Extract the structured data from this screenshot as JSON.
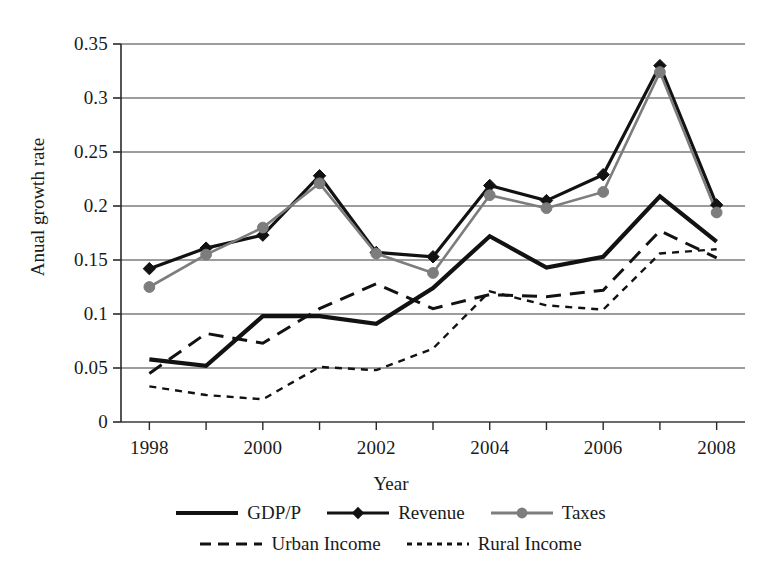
{
  "chart_data": {
    "type": "line",
    "title": "",
    "xlabel": "Year",
    "ylabel": "Anual growth rate",
    "x": [
      1998,
      1999,
      2000,
      2001,
      2002,
      2003,
      2004,
      2005,
      2006,
      2007,
      2008
    ],
    "xtick_labels": [
      "1998",
      "2000",
      "2002",
      "2004",
      "2006",
      "2008"
    ],
    "xtick_values": [
      1998,
      2000,
      2002,
      2004,
      2006,
      2008
    ],
    "xlim": [
      1997.5,
      2008.5
    ],
    "ytick_labels": [
      "0",
      "0.05",
      "0.1",
      "0.15",
      "0.2",
      "0.25",
      "0.3",
      "0.35"
    ],
    "ytick_values": [
      0,
      0.05,
      0.1,
      0.15,
      0.2,
      0.25,
      0.3,
      0.35
    ],
    "ylim": [
      0,
      0.35
    ],
    "grid": "horizontal",
    "legend_position": "bottom",
    "series": [
      {
        "name": "GDP/P",
        "color": "#121212",
        "style": "solid",
        "width": 4.2,
        "marker": "none",
        "values": [
          0.058,
          0.052,
          0.098,
          0.098,
          0.091,
          0.124,
          0.172,
          0.143,
          0.153,
          0.209,
          0.167
        ]
      },
      {
        "name": "Revenue",
        "color": "#121212",
        "style": "solid",
        "width": 3.2,
        "marker": "diamond",
        "values": [
          0.142,
          0.161,
          0.173,
          0.228,
          0.157,
          0.153,
          0.219,
          0.205,
          0.229,
          0.33,
          0.201
        ]
      },
      {
        "name": "Taxes",
        "color": "#7d7d7d",
        "style": "solid",
        "width": 2.6,
        "marker": "circle",
        "values": [
          0.125,
          0.155,
          0.18,
          0.221,
          0.156,
          0.138,
          0.21,
          0.198,
          0.213,
          0.324,
          0.194
        ]
      },
      {
        "name": "Urban Income",
        "color": "#121212",
        "style": "dashed-long",
        "width": 3.0,
        "marker": "none",
        "values": [
          0.045,
          0.082,
          0.073,
          0.105,
          0.128,
          0.105,
          0.118,
          0.116,
          0.122,
          0.177,
          0.152
        ]
      },
      {
        "name": "Rural Income",
        "color": "#121212",
        "style": "dashed-short",
        "width": 2.4,
        "marker": "none",
        "values": [
          0.033,
          0.025,
          0.021,
          0.051,
          0.048,
          0.068,
          0.121,
          0.108,
          0.104,
          0.156,
          0.16
        ]
      }
    ]
  },
  "axes": {
    "ylabel": "Anual growth rate",
    "xlabel": "Year",
    "yticks": [
      "0.35",
      "0.3",
      "0.25",
      "0.2",
      "0.15",
      "0.1",
      "0.05",
      "0"
    ],
    "xticks": [
      "1998",
      "2000",
      "2002",
      "2004",
      "2006",
      "2008"
    ]
  },
  "legend": {
    "row1": [
      {
        "label": "GDP/P",
        "icon": "solid-line-swatch"
      },
      {
        "label": "Revenue",
        "icon": "diamond-marker-line-swatch"
      },
      {
        "label": "Taxes",
        "icon": "circle-marker-line-swatch"
      }
    ],
    "row2": [
      {
        "label": "Urban Income",
        "icon": "long-dashed-line-swatch"
      },
      {
        "label": "Rural Income",
        "icon": "short-dashed-line-swatch"
      }
    ]
  }
}
